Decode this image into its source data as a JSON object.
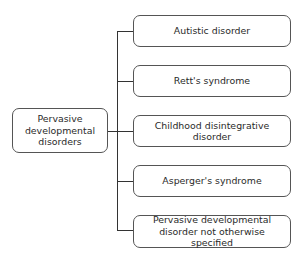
{
  "diagram": {
    "root": {
      "label": "Pervasive\ndevelopmental\ndisorders"
    },
    "children": [
      {
        "label": "Autistic disorder"
      },
      {
        "label": "Rett's syndrome"
      },
      {
        "label": "Childhood disintegrative\ndisorder"
      },
      {
        "label": "Asperger's syndrome"
      },
      {
        "label": "Pervasive developmental\ndisorder not otherwise specified"
      }
    ],
    "colors": {
      "border": "#555555",
      "line": "#333333",
      "text": "#2a2a2a",
      "background": "#ffffff"
    }
  }
}
